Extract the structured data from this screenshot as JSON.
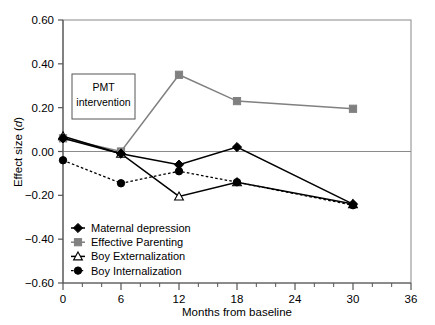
{
  "chart_data": {
    "type": "line",
    "title": "",
    "xlabel": "Months from baseline",
    "ylabel": "Effect size (d)",
    "ylabel_plain": "Effect size (",
    "ylabel_italic": "d",
    "ylabel_close": ")",
    "xlim": [
      0,
      36
    ],
    "ylim": [
      -0.6,
      0.6
    ],
    "x": [
      0,
      6,
      12,
      18,
      30
    ],
    "xticks": [
      0,
      6,
      12,
      18,
      24,
      30,
      36
    ],
    "xtick_labels": [
      "0",
      "6",
      "12",
      "18",
      "24",
      "30",
      "36"
    ],
    "xminor_step": 2,
    "yticks": [
      -0.6,
      -0.4,
      -0.2,
      0.0,
      0.2,
      0.4,
      0.6
    ],
    "ytick_labels": [
      "−0.60",
      "−0.40",
      "−0.20",
      "0.00",
      "0.20",
      "0.40",
      "0.60"
    ],
    "grid": false,
    "zero_line": true,
    "legend_position": "lower-left-inside",
    "series": [
      {
        "name": "Maternal depression",
        "marker": "filled-diamond",
        "line_style": "solid",
        "color": "#000000",
        "values": [
          0.06,
          -0.01,
          -0.06,
          0.02,
          -0.24
        ]
      },
      {
        "name": "Effective Parenting",
        "marker": "filled-square",
        "line_style": "solid",
        "color": "#808080",
        "values": [
          0.06,
          0.0,
          0.35,
          0.23,
          0.195
        ]
      },
      {
        "name": "Boy Externalization",
        "marker": "open-triangle",
        "line_style": "solid",
        "color": "#000000",
        "values": [
          0.07,
          -0.01,
          -0.205,
          -0.14,
          -0.24
        ]
      },
      {
        "name": "Boy Internalization",
        "marker": "filled-circle",
        "line_style": "dotted",
        "color": "#000000",
        "values": [
          -0.04,
          -0.145,
          -0.09,
          -0.14,
          -0.245
        ]
      }
    ],
    "annotations": [
      {
        "name": "pmt-intervention-box",
        "line1": "PMT",
        "line2": "intervention",
        "box": true
      }
    ]
  }
}
